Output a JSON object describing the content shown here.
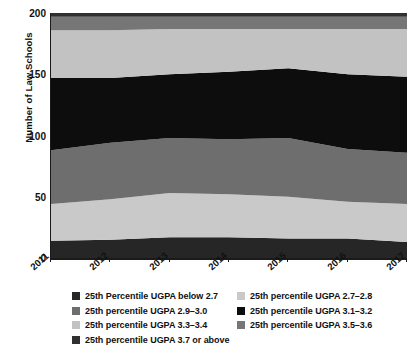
{
  "chart_data": {
    "type": "area",
    "title": "",
    "subtitle": "",
    "xlabel": "",
    "ylabel": "Number of Law Schools",
    "categories": [
      "2011",
      "2012",
      "2013",
      "2014",
      "2015",
      "2016",
      "2017"
    ],
    "x": [
      2011,
      2012,
      2013,
      2014,
      2015,
      2016,
      2017
    ],
    "ylim": [
      0,
      200
    ],
    "yticks": [
      0,
      50,
      100,
      150,
      200
    ],
    "grid": false,
    "stacked": true,
    "legend_position": "bottom",
    "series": [
      {
        "name": "25th Percentile UGPA below 2.7",
        "color": "#262626",
        "values": [
          14,
          15,
          17,
          17,
          16,
          16,
          13
        ]
      },
      {
        "name": "25th percentile UGPA 2.7–2.8",
        "color": "#c9c9c9",
        "values": [
          30,
          33,
          36,
          35,
          34,
          30,
          31
        ]
      },
      {
        "name": "25th percentile UGPA 2.9–3.0",
        "color": "#6e6e6e",
        "values": [
          44,
          46,
          45,
          45,
          48,
          43,
          42
        ]
      },
      {
        "name": "25th percentile UGPA 3.1–3.2",
        "color": "#0d0d0d",
        "values": [
          59,
          53,
          52,
          55,
          57,
          61,
          62
        ]
      },
      {
        "name": "25th percentile UGPA 3.3–3.4",
        "color": "#c2c2c2",
        "values": [
          39,
          39,
          37,
          35,
          32,
          37,
          39
        ]
      },
      {
        "name": "25th percentile UGPA 3.5–3.6",
        "color": "#767676",
        "values": [
          11,
          11,
          10,
          10,
          10,
          10,
          10
        ]
      },
      {
        "name": "25th percentile UGPA 3.7 or above",
        "color": "#303030",
        "values": [
          3,
          3,
          3,
          3,
          3,
          3,
          3
        ]
      }
    ]
  },
  "legend": {
    "rows": [
      [
        {
          "label": "25th Percentile UGPA below 2.7",
          "color": "#262626"
        },
        {
          "label": "25th percentile UGPA 2.7–2.8",
          "color": "#c9c9c9"
        }
      ],
      [
        {
          "label": "25th percentile UGPA 2.9–3.0",
          "color": "#6e6e6e"
        },
        {
          "label": "25th percentile UGPA 3.1–3.2",
          "color": "#0d0d0d"
        }
      ],
      [
        {
          "label": "25th percentile UGPA 3.3–3.4",
          "color": "#c2c2c2"
        },
        {
          "label": "25th percentile UGPA 3.5–3.6",
          "color": "#767676"
        }
      ],
      [
        {
          "label": "25th percentile UGPA 3.7 or above",
          "color": "#303030"
        }
      ]
    ]
  },
  "axis": {
    "y_title": "Number of Law Schools",
    "y_tick_labels": [
      "200",
      "150",
      "100",
      "50",
      "0"
    ],
    "x_tick_labels": [
      "2011",
      "2012",
      "2013",
      "2014",
      "2015",
      "2016",
      "2017"
    ]
  }
}
